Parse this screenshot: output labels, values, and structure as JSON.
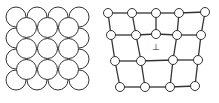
{
  "figure": {
    "left_panel": {
      "label": "packed-atom-lattice",
      "outer_grid": {
        "rows": 4,
        "cols": 4
      },
      "interstitial_grid": {
        "rows": 3,
        "cols": 3
      },
      "vacancy": {
        "row": 2,
        "col": 2
      }
    },
    "right_panel": {
      "label": "dislocation-lattice",
      "rows_of_nodes": [
        5,
        5,
        5,
        4
      ],
      "dislocation_symbol": "⊥"
    },
    "colors": {
      "stroke": "#333333",
      "fill": "#ffffff"
    }
  }
}
